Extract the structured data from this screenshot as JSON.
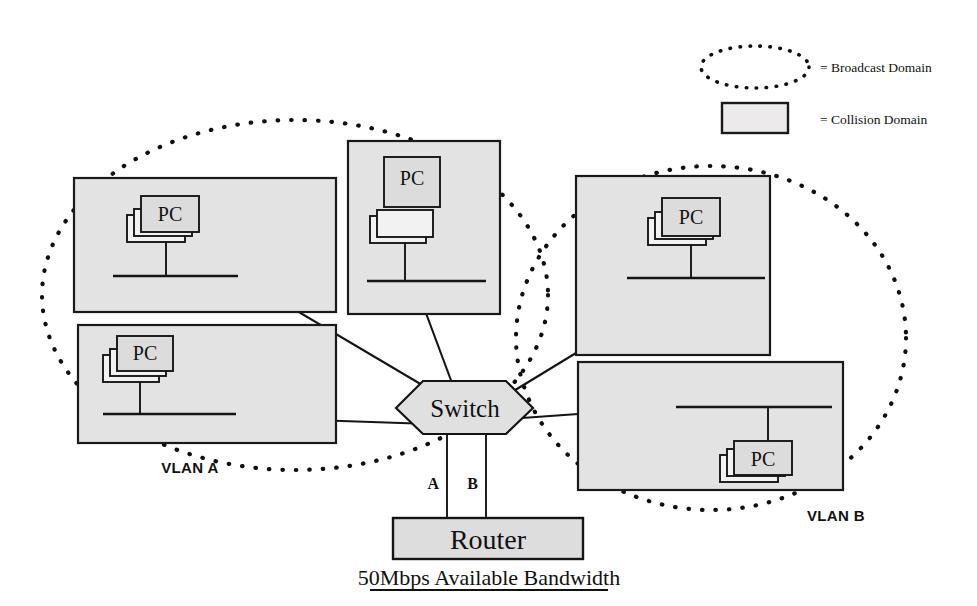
{
  "figure": {
    "caption": "50Mbps Available Bandwidth",
    "background_color": "#ffffff",
    "ink_color": "#111111",
    "domain_fill_color": "#e3e3e3"
  },
  "legend": {
    "items": [
      {
        "symbol": "dotted-ellipse",
        "label": "= Broadcast Domain",
        "icon_name": "broadcast-domain-ellipse-icon"
      },
      {
        "symbol": "shaded-rectangle",
        "label": "= Collision Domain",
        "icon_name": "collision-domain-rect-icon"
      }
    ]
  },
  "broadcast_domains": [
    {
      "id": "vlan-a",
      "label": "VLAN A"
    },
    {
      "id": "vlan-b",
      "label": "VLAN B"
    }
  ],
  "collision_domains": [
    {
      "id": "cd-top-left",
      "node_label": "PC",
      "vlan": "VLAN A"
    },
    {
      "id": "cd-bottom-left",
      "node_label": "PC",
      "vlan": "VLAN A"
    },
    {
      "id": "cd-top-center",
      "node_label": "PC",
      "vlan": "VLAN A"
    },
    {
      "id": "cd-top-right",
      "node_label": "PC",
      "vlan": "VLAN B"
    },
    {
      "id": "cd-bottom-right",
      "node_label": "PC",
      "vlan": "VLAN B"
    }
  ],
  "devices": {
    "switch": {
      "label": "Switch",
      "shape": "hexagon"
    },
    "router": {
      "label": "Router",
      "shape": "rectangle"
    }
  },
  "switch_ports": [
    {
      "label": "A",
      "to": "Router"
    },
    {
      "label": "B",
      "to": "Router"
    }
  ],
  "node_label": "PC"
}
